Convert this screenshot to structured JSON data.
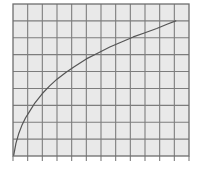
{
  "figure": {
    "title": "",
    "background_color": "#ffffff",
    "width": 198,
    "height": 170
  },
  "chart_data": {
    "type": "line",
    "title": "",
    "subtitle": "",
    "xlabel": "",
    "ylabel": "",
    "legend": [],
    "legend_position": "none",
    "grid": true,
    "grid_columns": 12,
    "grid_rows": 9,
    "xlim": [
      0,
      12
    ],
    "ylim": [
      0,
      9
    ],
    "xticks": [
      0,
      1,
      2,
      3,
      4,
      5,
      6,
      7,
      8,
      9,
      10,
      11,
      12
    ],
    "yticks": [
      0,
      1,
      2,
      3,
      4,
      5,
      6,
      7,
      8,
      9
    ],
    "xtick_labels": [],
    "ytick_labels": [],
    "annotations": [],
    "series": [
      {
        "name": "curve",
        "style": "solid",
        "color": "#555555",
        "line_width": 1.2,
        "shape": "concave-down increasing",
        "x": [
          0.05,
          0.2,
          0.4,
          0.6,
          0.85,
          1.1,
          1.5,
          2.0,
          2.5,
          3.0,
          3.6,
          4.2,
          5.0,
          5.8,
          6.6,
          7.4,
          8.2,
          9.0,
          9.8,
          10.5,
          11.1
        ],
        "y": [
          0.05,
          0.75,
          1.35,
          1.8,
          2.25,
          2.6,
          3.15,
          3.7,
          4.15,
          4.55,
          4.95,
          5.3,
          5.75,
          6.1,
          6.45,
          6.75,
          7.05,
          7.3,
          7.55,
          7.8,
          8.0
        ]
      }
    ]
  },
  "plot_area": {
    "left": 13,
    "top": 4,
    "right": 189,
    "bottom": 156,
    "cell_fill": "#e9e9e9",
    "grid_line_color": "#7d7d7d",
    "border_color": "#6e6e6e",
    "tick_color": "#7d7d7d",
    "tick_length": 5
  }
}
